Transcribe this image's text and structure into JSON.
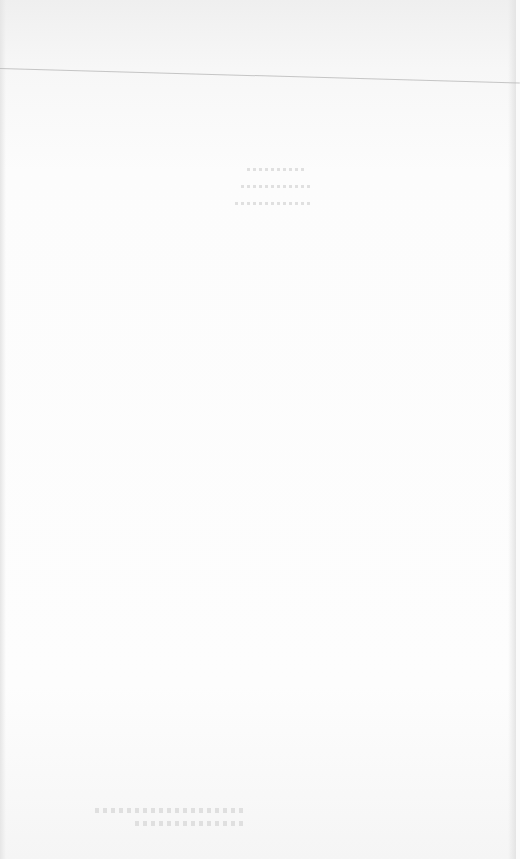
{
  "document": {
    "type": "scanned-page",
    "content_state": "blank page with faint illegible text",
    "illegible_text_blocks": 2
  }
}
